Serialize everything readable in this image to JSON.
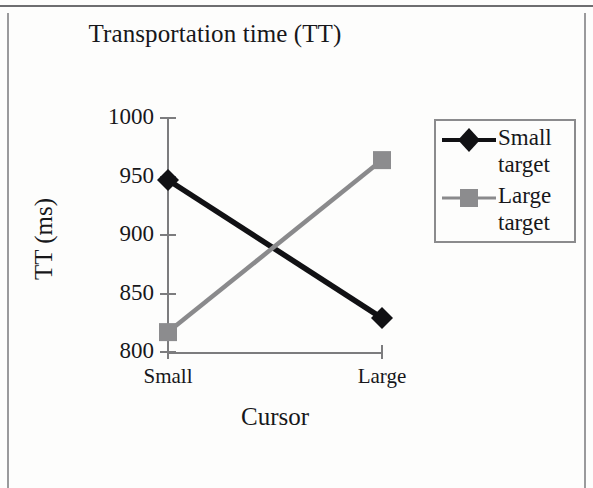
{
  "figure": {
    "title": "Transportation time (TT)"
  },
  "chart_data": {
    "type": "line",
    "title": "Transportation time (TT)",
    "xlabel": "Cursor",
    "ylabel": "TT (ms)",
    "categories": [
      "Small",
      "Large"
    ],
    "xticklabels": [
      "Small",
      "Large"
    ],
    "yticklabels": [
      "800",
      "850",
      "900",
      "950",
      "1000"
    ],
    "yticks": [
      800,
      850,
      900,
      950,
      1000
    ],
    "ylim": [
      800,
      1000
    ],
    "grid": false,
    "legend_position": "right",
    "series": [
      {
        "name": "Small target",
        "values": [
          947,
          829
        ],
        "color": "#111114",
        "marker": "diamond",
        "marker_color": "#111114"
      },
      {
        "name": "Large target",
        "values": [
          817,
          964
        ],
        "color": "#8a8a8c",
        "marker": "square",
        "marker_color": "#8c8c8e"
      }
    ]
  },
  "legend": {
    "entries": [
      {
        "label_line1": "Small",
        "label_line2": "target",
        "marker": "diamond-marker-icon"
      },
      {
        "label_line1": "Large",
        "label_line2": "target",
        "marker": "square-marker-icon"
      }
    ]
  }
}
